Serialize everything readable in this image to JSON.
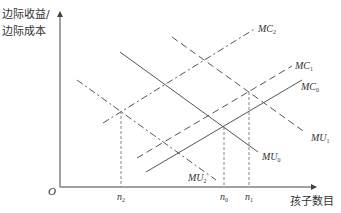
{
  "axes": {
    "y_label_line1": "边际收益/",
    "y_label_line2": "边际成本",
    "x_label": "孩子数目",
    "origin": "O"
  },
  "curves": {
    "MC2": {
      "name": "MC",
      "sub": "2",
      "style": "dash-dot"
    },
    "MC1": {
      "name": "MC",
      "sub": "1",
      "style": "dashed"
    },
    "MC0": {
      "name": "MC",
      "sub": "0",
      "style": "solid"
    },
    "MU1": {
      "name": "MU",
      "sub": "1",
      "style": "dashed"
    },
    "MU0": {
      "name": "MU",
      "sub": "0",
      "style": "solid"
    },
    "MU2": {
      "name": "MU",
      "sub": "2",
      "style": "dash-dot"
    }
  },
  "ticks": {
    "n2": {
      "name": "n",
      "sub": "2"
    },
    "n0": {
      "name": "n",
      "sub": "0"
    },
    "n1": {
      "name": "n",
      "sub": "1"
    }
  },
  "colors": {
    "line": "#555555",
    "text": "#333333"
  }
}
